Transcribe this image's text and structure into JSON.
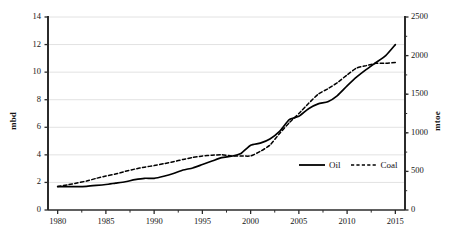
{
  "chart_data": {
    "type": "line",
    "title": "",
    "subtitle": "",
    "xlabel": "",
    "ylabel": "mbd",
    "y2label": "mtoe",
    "xlim": [
      1979,
      2016
    ],
    "ylim": [
      0,
      14
    ],
    "y2lim": [
      0,
      2500
    ],
    "grid": true,
    "legend_position": "inside-bottom-right",
    "x_ticks": [
      1980,
      1985,
      1990,
      1995,
      2000,
      2005,
      2010,
      2015
    ],
    "x_tick_labels": [
      "1980",
      "1985",
      "1990",
      "1995",
      "2000",
      "2005",
      "2010",
      "2015"
    ],
    "y_ticks": [
      0,
      2,
      4,
      6,
      8,
      10,
      12,
      14
    ],
    "y_tick_labels": [
      "0",
      "2",
      "4",
      "6",
      "8",
      "10",
      "12",
      "14"
    ],
    "y2_ticks": [
      0,
      500,
      1000,
      1500,
      2000,
      2500
    ],
    "y2_tick_labels": [
      "0",
      "500",
      "1000",
      "1500",
      "2000",
      "2500"
    ],
    "x": [
      1980,
      1981,
      1982,
      1983,
      1984,
      1985,
      1986,
      1987,
      1988,
      1989,
      1990,
      1991,
      1992,
      1993,
      1994,
      1995,
      1996,
      1997,
      1998,
      1999,
      2000,
      2001,
      2002,
      2003,
      2004,
      2005,
      2006,
      2007,
      2008,
      2009,
      2010,
      2011,
      2012,
      2013,
      2014,
      2015
    ],
    "series": [
      {
        "name": "Oil",
        "axis": "left",
        "units": "mbd",
        "style": "solid",
        "color": "#000000",
        "values": [
          1.7,
          1.7,
          1.7,
          1.72,
          1.78,
          1.85,
          1.95,
          2.05,
          2.2,
          2.3,
          2.3,
          2.45,
          2.65,
          2.9,
          3.05,
          3.3,
          3.55,
          3.8,
          3.9,
          4.1,
          4.7,
          4.85,
          5.15,
          5.7,
          6.55,
          6.8,
          7.35,
          7.7,
          7.85,
          8.3,
          9.0,
          9.65,
          10.2,
          10.7,
          11.2,
          12.0
        ]
      },
      {
        "name": "Coal",
        "axis": "right",
        "units": "mtoe",
        "style": "dashed",
        "color": "#000000",
        "values": [
          305,
          325,
          350,
          375,
          410,
          440,
          465,
          500,
          530,
          555,
          575,
          600,
          625,
          655,
          680,
          700,
          710,
          715,
          700,
          700,
          700,
          760,
          840,
          990,
          1130,
          1250,
          1380,
          1500,
          1570,
          1650,
          1750,
          1840,
          1870,
          1900,
          1900,
          1910
        ]
      }
    ]
  },
  "legend": {
    "entries": [
      {
        "label": "Oil",
        "style": "solid"
      },
      {
        "label": "Coal",
        "style": "dashed"
      }
    ]
  }
}
